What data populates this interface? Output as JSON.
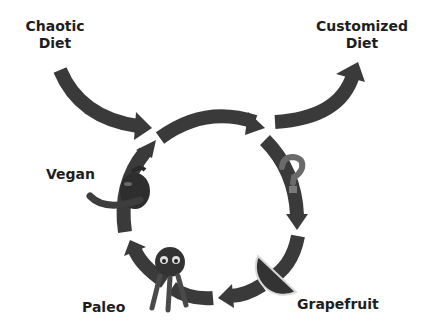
{
  "diagram": {
    "type": "cycle",
    "entry": {
      "label_line1": "Chaotic",
      "label_line2": "Diet"
    },
    "exit": {
      "label_line1": "Customized",
      "label_line2": "Diet"
    },
    "cycle_nodes": [
      {
        "label": "",
        "icon": "question-mark-icon"
      },
      {
        "label": "Grapefruit",
        "icon": "grapefruit-icon"
      },
      {
        "label": "Paleo",
        "icon": "furry-monster-icon"
      },
      {
        "label": "Vegan",
        "icon": "chili-pepper-icon"
      }
    ],
    "colors": {
      "arrow": "#3a3a3a",
      "text": "#1e1e1e",
      "question_mark": "#6a6a6a",
      "background": "#ffffff"
    }
  }
}
